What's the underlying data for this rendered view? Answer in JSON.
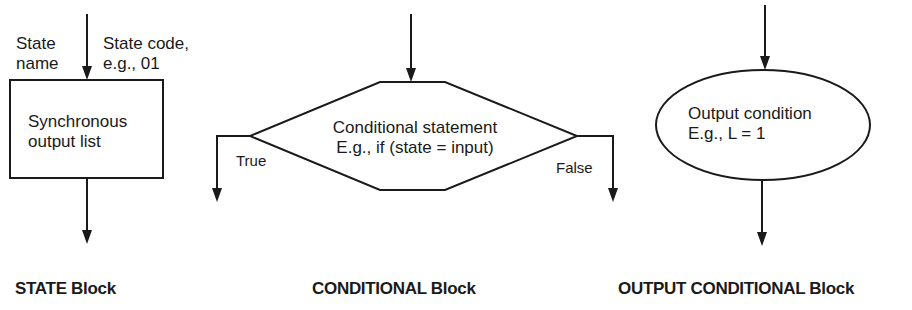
{
  "state_block": {
    "state_name_label": [
      "State",
      "name"
    ],
    "state_code_label": [
      "State code,",
      "e.g., 01"
    ],
    "box_text": [
      "Synchronous",
      "output list"
    ],
    "title": "STATE Block"
  },
  "conditional_block": {
    "box_text": [
      "Conditional statement",
      "E.g., if (state =  input)"
    ],
    "true_label": "True",
    "false_label": "False",
    "title": "CONDITIONAL Block"
  },
  "output_conditional_block": {
    "oval_text": [
      "Output condition",
      "E.g., L =  1"
    ],
    "title": "OUTPUT CONDITIONAL Block"
  },
  "colors": {
    "stroke": "#1a1a1a",
    "background": "#ffffff"
  }
}
